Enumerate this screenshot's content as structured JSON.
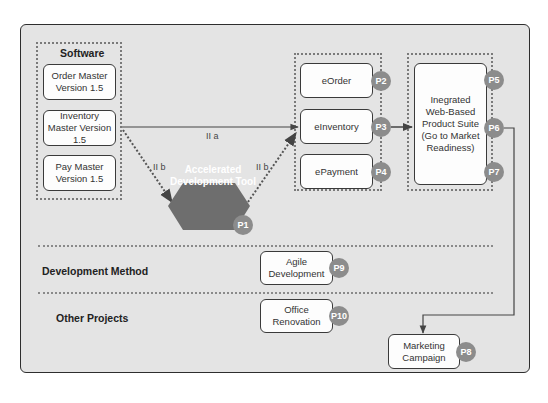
{
  "groups": {
    "software": {
      "title": "Software",
      "items": [
        {
          "label": "Order Master Version 1.5"
        },
        {
          "label": "Inventory Master Version 1.5"
        },
        {
          "label": "Pay Master Version 1.5"
        }
      ]
    },
    "e_products": {
      "items": [
        {
          "label": "eOrder",
          "badge": "P2"
        },
        {
          "label": "eInventory",
          "badge": "P3"
        },
        {
          "label": "ePayment",
          "badge": "P4"
        }
      ]
    },
    "suite": {
      "label": "Inegrated Web-Based Product Suite (Go to Market Readiness)",
      "badges": [
        "P5",
        "P6",
        "P7"
      ]
    }
  },
  "tool": {
    "label": "Accelerated Development Tool",
    "badge": "P1"
  },
  "edges": {
    "path_a": "II a",
    "path_b_left": "II b",
    "path_b_right": "II b"
  },
  "rows": {
    "development_method": {
      "title": "Development Method",
      "item": "Agile Development",
      "badge": "P9"
    },
    "other_projects": {
      "title": "Other Projects",
      "item": "Office Renovation",
      "badge": "P10"
    }
  },
  "marketing": {
    "label": "Marketing Campaign",
    "badge": "P8"
  },
  "colors": {
    "badge": "#8c8c8c",
    "hexagon": "#6e6e6e",
    "background": "#e4e4e4"
  }
}
